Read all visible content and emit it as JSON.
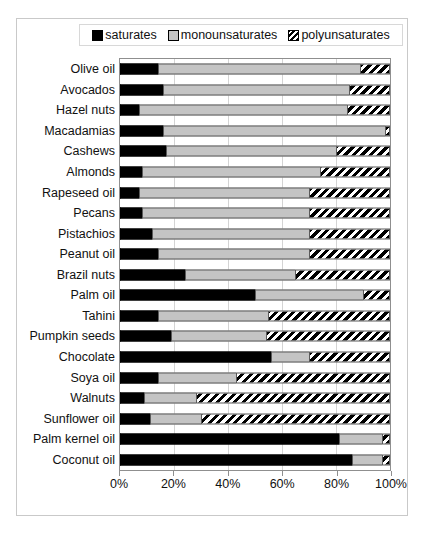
{
  "chart_data": {
    "type": "bar",
    "orientation": "horizontal",
    "stacked": true,
    "title": "",
    "xlabel": "",
    "ylabel": "",
    "xlim": [
      0,
      100
    ],
    "xticks": [
      "0%",
      "20%",
      "40%",
      "60%",
      "80%",
      "100%"
    ],
    "xtick_values": [
      0,
      20,
      40,
      60,
      80,
      100
    ],
    "grid": true,
    "legend_position": "top",
    "colors": {
      "saturates": "#000000",
      "monounsaturates": "#c4c4c4",
      "polyunsaturates": "#000000",
      "plot_border": "#8f8f8f",
      "gridline": "#d4d4d4",
      "frame_border": "#c9c9c9"
    },
    "legend": [
      {
        "label": "saturates",
        "pattern": "solid-black"
      },
      {
        "label": "monounsaturates",
        "pattern": "solid-gray"
      },
      {
        "label": "polyunsaturates",
        "pattern": "diagonal-stripes"
      }
    ],
    "series": [
      {
        "name": "saturates",
        "values": [
          14,
          16,
          7,
          16,
          17,
          8,
          7,
          8,
          12,
          14,
          24,
          50,
          14,
          19,
          56,
          14,
          9,
          11,
          81,
          86
        ]
      },
      {
        "name": "monounsaturates",
        "values": [
          75,
          69,
          77,
          82,
          63,
          66,
          63,
          62,
          58,
          56,
          41,
          40,
          41,
          35,
          14,
          29,
          19,
          19,
          16,
          11
        ]
      },
      {
        "name": "polyunsaturates",
        "values": [
          11,
          15,
          16,
          2,
          20,
          26,
          30,
          30,
          30,
          30,
          35,
          10,
          45,
          46,
          30,
          57,
          72,
          70,
          3,
          3
        ]
      }
    ],
    "categories": [
      "Olive oil",
      "Avocados",
      "Hazel nuts",
      "Macadamias",
      "Cashews",
      "Almonds",
      "Rapeseed oil",
      "Pecans",
      "Pistachios",
      "Peanut oil",
      "Brazil nuts",
      "Palm oil",
      "Tahini",
      "Pumpkin seeds",
      "Chocolate",
      "Soya oil",
      "Walnuts",
      "Sunflower oil",
      "Palm kernel oil",
      "Coconut oil"
    ]
  }
}
